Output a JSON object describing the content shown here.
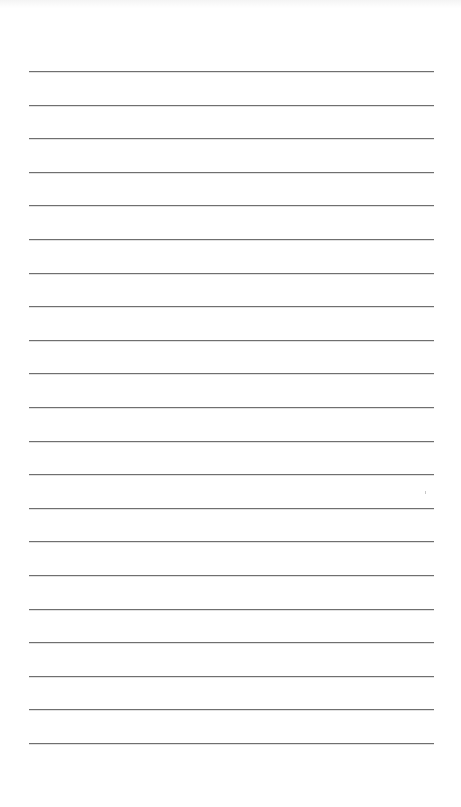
{
  "page": {
    "type": "lined-notepad-page",
    "background_color": "#ffffff",
    "line_color": "#6f6f6f",
    "line_count": 21,
    "line_start_x": 29,
    "line_end_x": 434,
    "first_line_y": 71,
    "line_spacing": 33.6,
    "lines": [
      {
        "index": 1,
        "text": ""
      },
      {
        "index": 2,
        "text": ""
      },
      {
        "index": 3,
        "text": ""
      },
      {
        "index": 4,
        "text": ""
      },
      {
        "index": 5,
        "text": ""
      },
      {
        "index": 6,
        "text": ""
      },
      {
        "index": 7,
        "text": ""
      },
      {
        "index": 8,
        "text": ""
      },
      {
        "index": 9,
        "text": ""
      },
      {
        "index": 10,
        "text": ""
      },
      {
        "index": 11,
        "text": ""
      },
      {
        "index": 12,
        "text": ""
      },
      {
        "index": 13,
        "text": ""
      },
      {
        "index": 14,
        "text": ""
      },
      {
        "index": 15,
        "text": ""
      },
      {
        "index": 16,
        "text": ""
      },
      {
        "index": 17,
        "text": ""
      },
      {
        "index": 18,
        "text": ""
      },
      {
        "index": 19,
        "text": ""
      },
      {
        "index": 20,
        "text": ""
      },
      {
        "index": 21,
        "text": ""
      }
    ]
  }
}
